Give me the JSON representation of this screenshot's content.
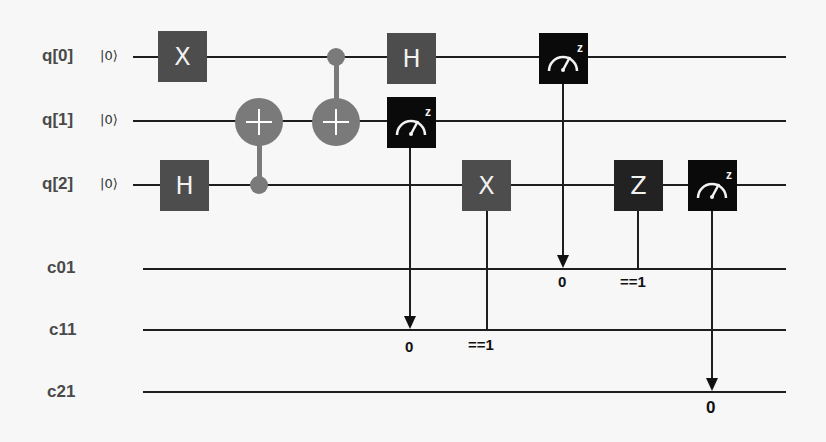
{
  "circuit": {
    "qubits": [
      {
        "label": "q[0]",
        "init": "|0⟩"
      },
      {
        "label": "q[1]",
        "init": "|0⟩"
      },
      {
        "label": "q[2]",
        "init": "|0⟩"
      }
    ],
    "classical": [
      {
        "label": "c01"
      },
      {
        "label": "c11"
      },
      {
        "label": "c21"
      }
    ],
    "gates": {
      "x_q0": "X",
      "h_q2": "H",
      "h_q0": "H",
      "x_q2": "X",
      "z_q2": "Z",
      "measure_basis": "z"
    },
    "annotations": {
      "m_q1_result": "0",
      "m_q0_result": "0",
      "m_q2_result": "0",
      "x_cond": "==1",
      "z_cond": "==1"
    }
  },
  "colors": {
    "gate_gray": "#4d4d4d",
    "gate_dark": "#222222",
    "gate_black": "#0a0a0a",
    "cnot": "#7a7a7a",
    "wire": "#1e1e1e",
    "background": "#f7f7f7"
  }
}
